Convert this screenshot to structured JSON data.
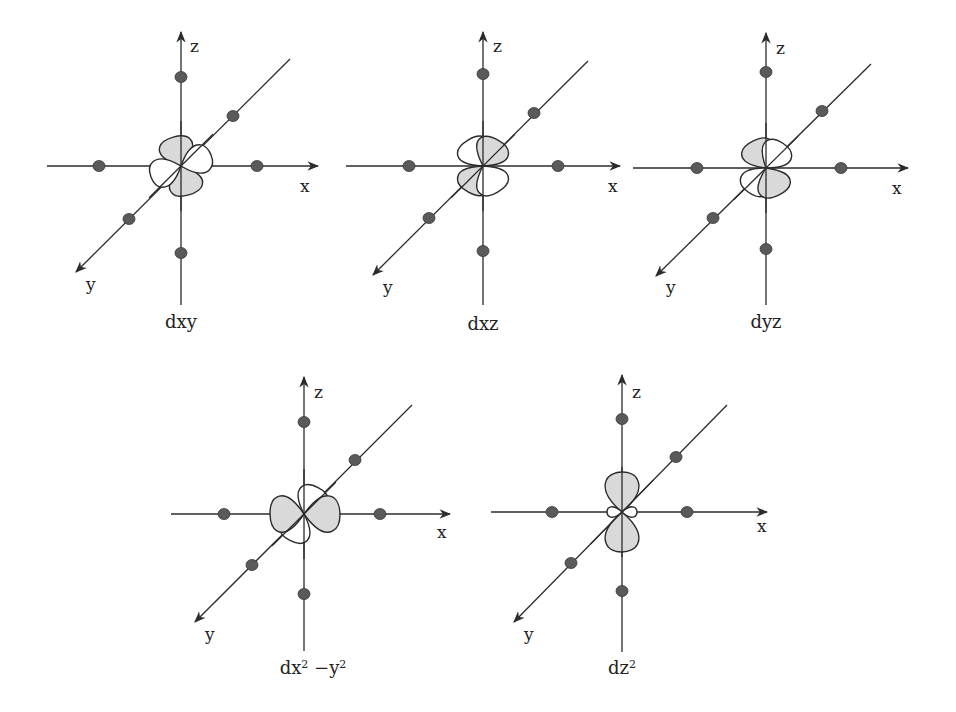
{
  "figure": {
    "colors": {
      "axis": "#2b2b2b",
      "ligand": "#5a5a5a",
      "lobe_shaded": "#d9d9d9",
      "lobe_white": "#ffffff",
      "background": "#ffffff"
    },
    "panels": [
      {
        "id": "dxy",
        "caption": "dxy",
        "caption_parts": [
          {
            "text": "dxy"
          }
        ],
        "origin": [
          181,
          166
        ],
        "z_top": [
          181,
          32
        ],
        "z_bottom": [
          181,
          305
        ],
        "x_left": [
          47,
          166
        ],
        "x_right": [
          318,
          166
        ],
        "diag_top": [
          290,
          59
        ],
        "diag_bottom": [
          76,
          272
        ],
        "ligands": [
          [
            181,
            77
          ],
          [
            181,
            253
          ],
          [
            99,
            166
          ],
          [
            257,
            166
          ],
          [
            233,
            116
          ],
          [
            129,
            219
          ]
        ],
        "labels": {
          "z": {
            "text": "z",
            "pos": [
              190,
              52
            ]
          },
          "x": {
            "text": "x",
            "pos": [
              300,
              192
            ]
          },
          "y": {
            "text": "y",
            "pos": [
              86,
              290
            ]
          }
        },
        "caption_pos": [
          181,
          328
        ],
        "lobes": [
          {
            "angle": -105,
            "len": 30,
            "w": 13,
            "fill": "shaded"
          },
          {
            "angle": 75,
            "len": 30,
            "w": 13,
            "fill": "shaded"
          },
          {
            "angle": -20,
            "len": 32,
            "w": 11,
            "fill": "white"
          },
          {
            "angle": 160,
            "len": 32,
            "w": 11,
            "fill": "white"
          }
        ]
      },
      {
        "id": "dxz",
        "caption": "dxz",
        "caption_parts": [
          {
            "text": "dxz"
          }
        ],
        "origin": [
          483,
          166
        ],
        "z_top": [
          483,
          32
        ],
        "z_bottom": [
          483,
          305
        ],
        "x_left": [
          346,
          166
        ],
        "x_right": [
          620,
          166
        ],
        "diag_top": [
          588,
          61
        ],
        "diag_bottom": [
          373,
          275
        ],
        "ligands": [
          [
            483,
            74
          ],
          [
            483,
            251
          ],
          [
            409,
            166
          ],
          [
            558,
            166
          ],
          [
            534,
            113
          ],
          [
            429,
            218
          ]
        ],
        "labels": {
          "z": {
            "text": "z",
            "pos": [
              493,
              52
            ]
          },
          "x": {
            "text": "x",
            "pos": [
              608,
              192
            ]
          },
          "y": {
            "text": "y",
            "pos": [
              383,
              293
            ]
          }
        },
        "caption_pos": [
          483,
          330
        ],
        "lobes": [
          {
            "angle": -120,
            "len": 30,
            "w": 13,
            "fill": "white"
          },
          {
            "angle": -60,
            "len": 30,
            "w": 13,
            "fill": "shaded"
          },
          {
            "angle": 120,
            "len": 30,
            "w": 13,
            "fill": "shaded"
          },
          {
            "angle": 60,
            "len": 30,
            "w": 13,
            "fill": "white"
          }
        ]
      },
      {
        "id": "dyz",
        "caption": "dyz",
        "caption_parts": [
          {
            "text": "dyz"
          }
        ],
        "origin": [
          766,
          168
        ],
        "z_top": [
          766,
          33
        ],
        "z_bottom": [
          766,
          305
        ],
        "x_left": [
          633,
          168
        ],
        "x_right": [
          908,
          168
        ],
        "diag_top": [
          871,
          64
        ],
        "diag_bottom": [
          656,
          276
        ],
        "ligands": [
          [
            766,
            72
          ],
          [
            766,
            249
          ],
          [
            697,
            168
          ],
          [
            841,
            168
          ],
          [
            822,
            111
          ],
          [
            713,
            218
          ]
        ],
        "labels": {
          "z": {
            "text": "z",
            "pos": [
              776,
              54
            ]
          },
          "x": {
            "text": "x",
            "pos": [
              892,
              194
            ]
          },
          "y": {
            "text": "y",
            "pos": [
              666,
              293
            ]
          }
        },
        "caption_pos": [
          766,
          328
        ],
        "lobes": [
          {
            "angle": -115,
            "len": 30,
            "w": 13,
            "fill": "shaded"
          },
          {
            "angle": -55,
            "len": 30,
            "w": 12,
            "fill": "white"
          },
          {
            "angle": 125,
            "len": 30,
            "w": 12,
            "fill": "white"
          },
          {
            "angle": 65,
            "len": 30,
            "w": 13,
            "fill": "shaded"
          }
        ]
      },
      {
        "id": "dx2-y2",
        "caption": "dx2 −y2",
        "caption_parts": [
          {
            "text": "dx"
          },
          {
            "text": "2",
            "sup": true
          },
          {
            "text": " −y"
          },
          {
            "text": "2",
            "sup": true
          }
        ],
        "origin": [
          304,
          514
        ],
        "z_top": [
          304,
          377
        ],
        "z_bottom": [
          304,
          651
        ],
        "x_left": [
          171,
          514
        ],
        "x_right": [
          450,
          514
        ],
        "diag_top": [
          412,
          405
        ],
        "diag_bottom": [
          195,
          622
        ],
        "ligands": [
          [
            304,
            422
          ],
          [
            304,
            594
          ],
          [
            224,
            514
          ],
          [
            380,
            514
          ],
          [
            355,
            460
          ],
          [
            252,
            565
          ]
        ],
        "labels": {
          "z": {
            "text": "z",
            "pos": [
              314,
              398
            ]
          },
          "x": {
            "text": "x",
            "pos": [
              437,
              538
            ]
          },
          "y": {
            "text": "y",
            "pos": [
              205,
              640
            ]
          }
        },
        "caption_pos": [
          313,
          674
        ],
        "lobes": [
          {
            "angle": -62,
            "len": 30,
            "w": 12,
            "fill": "white"
          },
          {
            "angle": 118,
            "len": 30,
            "w": 12,
            "fill": "white"
          },
          {
            "angle": 180,
            "len": 34,
            "w": 14,
            "fill": "shaded"
          },
          {
            "angle": 0,
            "len": 36,
            "w": 14,
            "fill": "shaded"
          }
        ]
      },
      {
        "id": "dz2",
        "caption": "dz2",
        "caption_parts": [
          {
            "text": "dz"
          },
          {
            "text": "2",
            "sup": true
          }
        ],
        "origin": [
          622,
          512
        ],
        "z_top": [
          622,
          375
        ],
        "z_bottom": [
          622,
          652
        ],
        "x_left": [
          491,
          512
        ],
        "x_right": [
          767,
          512
        ],
        "diag_top": [
          727,
          405
        ],
        "diag_bottom": [
          514,
          622
        ],
        "ligands": [
          [
            622,
            419
          ],
          [
            622,
            591
          ],
          [
            552,
            512
          ],
          [
            687,
            512
          ],
          [
            676,
            457
          ],
          [
            571,
            563
          ]
        ],
        "labels": {
          "z": {
            "text": "z",
            "pos": [
              632,
              398
            ]
          },
          "x": {
            "text": "x",
            "pos": [
              757,
              532
            ]
          },
          "y": {
            "text": "y",
            "pos": [
              524,
              640
            ]
          }
        },
        "caption_pos": [
          622,
          674
        ],
        "lobes": [
          {
            "angle": -90,
            "len": 40,
            "w": 13,
            "fill": "shaded"
          },
          {
            "angle": 90,
            "len": 40,
            "w": 13,
            "fill": "shaded"
          },
          {
            "angle": 180,
            "len": 15,
            "w": 4,
            "fill": "white"
          },
          {
            "angle": 0,
            "len": 15,
            "w": 4,
            "fill": "white"
          }
        ]
      }
    ]
  }
}
